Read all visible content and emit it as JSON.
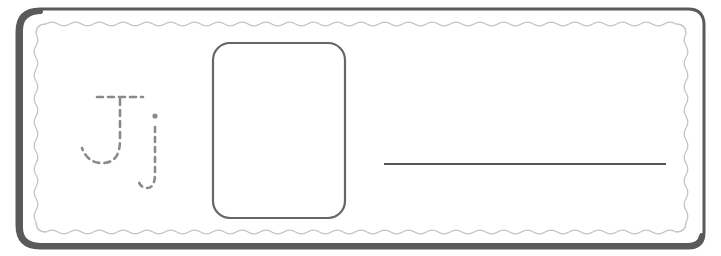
{
  "worksheet": {
    "letter_uppercase": "J",
    "letter_lowercase": "j",
    "tracing_style": "dashed",
    "drawing_box_label": "drawing box",
    "writing_line_label": "writing line"
  },
  "colors": {
    "frame": "#5a5a5a",
    "wavy_border": "#c4c4c4",
    "tracing": "#8a8a8a",
    "box": "#666666",
    "line": "#555555",
    "background": "#ffffff"
  }
}
